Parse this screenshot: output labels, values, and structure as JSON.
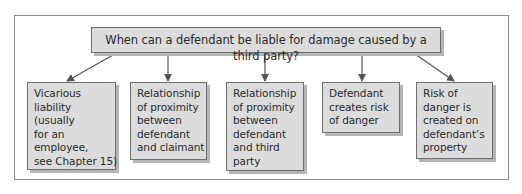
{
  "diagram": {
    "title": "When can a defendant be liable for damage caused by a third party?",
    "nodes": [
      {
        "lines": [
          "Vicarious",
          "liability",
          "(usually",
          "for an",
          "employee,",
          "see Chapter 15)"
        ]
      },
      {
        "lines": [
          "Relationship",
          "of proximity",
          "between",
          "defendant",
          "and claimant"
        ]
      },
      {
        "lines": [
          "Relationship",
          "of proximity",
          "between",
          "defendant",
          "and third",
          "party"
        ]
      },
      {
        "lines": [
          "Defendant",
          "creates risk",
          "of danger"
        ]
      },
      {
        "lines": [
          "Risk of",
          "danger is",
          "created on",
          "defendant’s",
          "property"
        ]
      }
    ],
    "colors": {
      "box_fill": "#dcdcdc",
      "box_border": "#6e6e6e",
      "arrow": "#555555"
    }
  }
}
